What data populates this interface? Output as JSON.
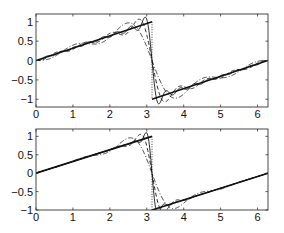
{
  "chart_data": [
    {
      "type": "line",
      "title": "",
      "xlabel": "",
      "ylabel": "",
      "xlim": [
        0,
        6.2832
      ],
      "ylim": [
        -1.2,
        1.2
      ],
      "xticks": [
        "0",
        "1",
        "2",
        "3",
        "4",
        "5",
        "6"
      ],
      "yticks": [
        "-1",
        "-0.5",
        "0",
        "0.5",
        "1"
      ],
      "grid": false,
      "description": "Truncated Fourier series approximations of a sawtooth wave showing Gibbs oscillations near the discontinuity at x = pi",
      "series": [
        {
          "name": "sawtooth (exact)",
          "style": "solid-thick",
          "function": "x/pi for x<pi, (x-2pi)/pi for x>pi"
        },
        {
          "name": "jump",
          "style": "dotted",
          "x": [
            3.1416,
            3.1416
          ],
          "y": [
            1,
            -1
          ]
        },
        {
          "name": "Fourier N large",
          "style": "solid-thin",
          "N": 16,
          "filter": "none"
        },
        {
          "name": "Fourier N medium",
          "style": "dashed",
          "N": 8,
          "filter": "none"
        },
        {
          "name": "Fourier N small",
          "style": "dash-dot",
          "N": 4,
          "filter": "none"
        }
      ]
    },
    {
      "type": "line",
      "title": "",
      "xlabel": "",
      "ylabel": "",
      "xlim": [
        0,
        6.2832
      ],
      "ylim": [
        -1,
        1.2
      ],
      "xticks": [
        "0",
        "1",
        "2",
        "3",
        "4",
        "5",
        "6"
      ],
      "yticks": [
        "-1",
        "-0.5",
        "0",
        "0.5",
        "1"
      ],
      "grid": false,
      "description": "Filtered (smoothed) Fourier approximations of the same sawtooth wave, oscillations suppressed",
      "series": [
        {
          "name": "sawtooth (exact)",
          "style": "solid-thick",
          "function": "x/pi for x<pi, (x-2pi)/pi for x>pi"
        },
        {
          "name": "jump",
          "style": "dotted",
          "x": [
            3.1416,
            3.1416
          ],
          "y": [
            1,
            -1
          ]
        },
        {
          "name": "filtered N large",
          "style": "solid-thin",
          "N": 32,
          "filter": "exponential"
        },
        {
          "name": "filtered N medium",
          "style": "dashed",
          "N": 16,
          "filter": "exponential"
        },
        {
          "name": "filtered N small",
          "style": "dash-dot",
          "N": 8,
          "filter": "exponential"
        }
      ]
    }
  ],
  "panels": [
    {
      "box": {
        "x": 36,
        "y": 14,
        "w": 232,
        "h": 93
      },
      "xtick_values": [
        0,
        1,
        2,
        3,
        4,
        5,
        6
      ],
      "ytick_values": [
        -1,
        -0.5,
        0,
        0.5,
        1
      ]
    },
    {
      "box": {
        "x": 36,
        "y": 129,
        "w": 232,
        "h": 81
      },
      "xtick_values": [
        0,
        1,
        2,
        3,
        4,
        5,
        6
      ],
      "ytick_values": [
        -1,
        -0.5,
        0,
        0.5,
        1
      ]
    }
  ],
  "colors": {
    "axis": "#333333",
    "line": "#111111"
  }
}
